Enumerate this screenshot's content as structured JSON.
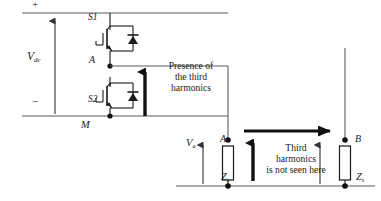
{
  "figure": {
    "type": "circuit-diagram"
  },
  "left_circuit": {
    "rail_positive_label": "+",
    "rail_negative_label": "−",
    "source_label": "V",
    "source_subscript": "dc",
    "switch_upper_label": "S1",
    "switch_lower_label": "S2",
    "node_midpoint_label": "A",
    "node_bottom_label": "M",
    "source_arrow_direction": "up",
    "harmonic_arrow_direction": "up"
  },
  "annotations": {
    "presence_note": [
      "Presence of",
      "the third",
      "harmonics"
    ],
    "absence_note": [
      "Third",
      "harmonics",
      "is not seen here"
    ]
  },
  "right_circuit": {
    "voltage_label": "V",
    "voltage_subscript": "a",
    "node_left_label": "A",
    "node_right_label": "B",
    "impedance_left_label": "Z",
    "impedance_left_subscript": "s",
    "impedance_right_label": "Z",
    "impedance_right_subscript": "s",
    "flow_arrow_direction": "right",
    "harmonic_arrow_direction": "up"
  },
  "colors": {
    "wire": "#5a5a5a",
    "component": "#1a1a1a",
    "arrow": "#111111",
    "text": "#1a1a1a",
    "background": "#ffffff"
  }
}
